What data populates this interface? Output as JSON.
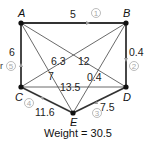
{
  "graph": {
    "vertices": [
      {
        "id": "A",
        "label": "A",
        "x": 21,
        "y": 23,
        "lx": 17,
        "ly": 17
      },
      {
        "id": "B",
        "label": "B",
        "x": 126,
        "y": 23,
        "lx": 122,
        "ly": 17
      },
      {
        "id": "C",
        "label": "C",
        "x": 21,
        "y": 87,
        "lx": 14,
        "ly": 100
      },
      {
        "id": "D",
        "label": "D",
        "x": 126,
        "y": 87,
        "lx": 124,
        "ly": 100
      },
      {
        "id": "E",
        "label": "E",
        "x": 73,
        "y": 113,
        "lx": 70,
        "ly": 126
      }
    ],
    "edges": [
      {
        "from": "A",
        "to": "B",
        "weight": "5",
        "bold": true,
        "order": "1"
      },
      {
        "from": "B",
        "to": "D",
        "weight": "0.4",
        "bold": true,
        "order": "2"
      },
      {
        "from": "D",
        "to": "E",
        "weight": "7.5",
        "bold": true,
        "order": "3"
      },
      {
        "from": "E",
        "to": "C",
        "weight": "11.6",
        "bold": true,
        "order": "4"
      },
      {
        "from": "C",
        "to": "A",
        "weight": "6",
        "bold": true,
        "order": "5"
      },
      {
        "from": "A",
        "to": "D",
        "weight": "12",
        "bold": false
      },
      {
        "from": "A",
        "to": "E",
        "weight": "7",
        "bold": false
      },
      {
        "from": "B",
        "to": "C",
        "weight": "6.3",
        "bold": false
      },
      {
        "from": "B",
        "to": "E",
        "weight": "0.4",
        "bold": false
      },
      {
        "from": "C",
        "to": "D",
        "weight": "13.5",
        "bold": false
      }
    ],
    "weight_labels": {
      "AB": "5",
      "BD": "0.4",
      "DE": "7.5",
      "EC": "11.6",
      "CA": "6",
      "AD": "12",
      "AE": "7",
      "BC": "6.3",
      "BE": "0.4",
      "CD": "13.5"
    },
    "order_labels": {
      "one": "1",
      "two": "2",
      "three": "3",
      "four": "4",
      "five": "5"
    },
    "vertex_labels": {
      "A": "A",
      "B": "B",
      "C": "C",
      "D": "D",
      "E": "E"
    }
  },
  "caption": {
    "total_weight": "Weight = 30.5",
    "cropped_left_char": "r"
  }
}
